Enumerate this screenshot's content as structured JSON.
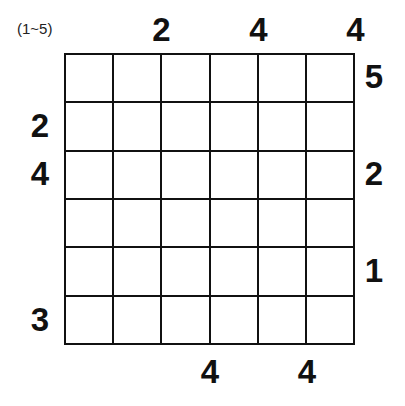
{
  "puzzle": {
    "range_label": "(1~5)",
    "top": [
      "",
      "2",
      "",
      "4",
      "",
      "4"
    ],
    "bottom": [
      "",
      "",
      "4",
      "",
      "4",
      ""
    ],
    "left": [
      "",
      "2",
      "4",
      "",
      "",
      "3"
    ],
    "right": [
      "5",
      "",
      "2",
      "",
      "1",
      ""
    ],
    "rows": 6,
    "cols": 6
  }
}
